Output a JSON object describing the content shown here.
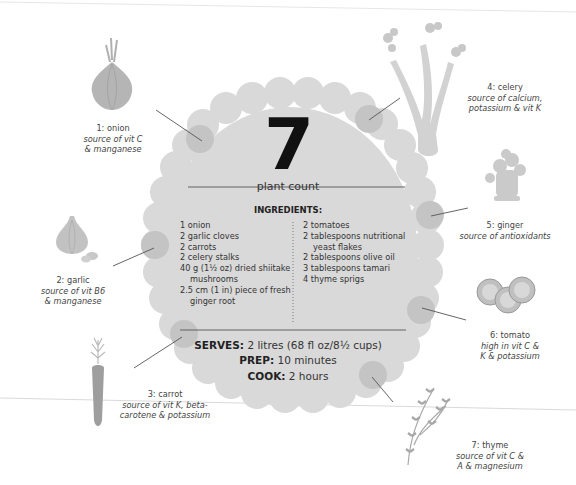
{
  "summary": {
    "count": "7",
    "count_label": "plant count"
  },
  "ingredients": {
    "heading": "INGREDIENTS:",
    "left": [
      {
        "text": "1 onion"
      },
      {
        "text": "2 garlic cloves"
      },
      {
        "text": "2 carrots"
      },
      {
        "text": "2 celery stalks"
      },
      {
        "text": "40 g (1½ oz) dried shiitake",
        "cont": "mushrooms"
      },
      {
        "text": "2.5 cm (1 in) piece of fresh",
        "cont": "ginger root"
      }
    ],
    "right": [
      {
        "text": "2 tomatoes"
      },
      {
        "text": "2 tablespoons nutritional",
        "cont": "yeast flakes"
      },
      {
        "text": "2 tablespoons olive oil"
      },
      {
        "text": "3 tablespoons tamari"
      },
      {
        "text": "4 thyme sprigs"
      }
    ]
  },
  "meta": {
    "serves_label": "SERVES:",
    "serves_value": "2 litres (68 fl oz/8½ cups)",
    "prep_label": "PREP:",
    "prep_value": "10 minutes",
    "cook_label": "COOK:",
    "cook_value": "2 hours"
  },
  "plants": [
    {
      "name": "1: onion",
      "line1": "source of vit C",
      "line2": "& manganese",
      "icon": "onion-icon"
    },
    {
      "name": "2: garlic",
      "line1": "source of vit B6",
      "line2": "& manganese",
      "icon": "garlic-icon"
    },
    {
      "name": "3: carrot",
      "line1": "source of vit K, beta-",
      "line2": "carotene & potassium",
      "icon": "carrot-icon"
    },
    {
      "name": "4: celery",
      "line1": "source of calcium,",
      "line2": "potassium & vit K",
      "icon": "celery-icon"
    },
    {
      "name": "5: ginger",
      "line1": "source of antioxidants",
      "line2": "",
      "icon": "ginger-icon"
    },
    {
      "name": "6: tomato",
      "line1": "high in vit C &",
      "line2": "K & potassium",
      "icon": "tomato-icon"
    },
    {
      "name": "7: thyme",
      "line1": "source of vit C &",
      "line2": "A & magnesium",
      "icon": "thyme-icon"
    }
  ],
  "colors": {
    "blob": "#d9d9d9",
    "accent_dot": "#c4c4c4",
    "illustration": "#b8b8b8",
    "text": "#333333"
  }
}
